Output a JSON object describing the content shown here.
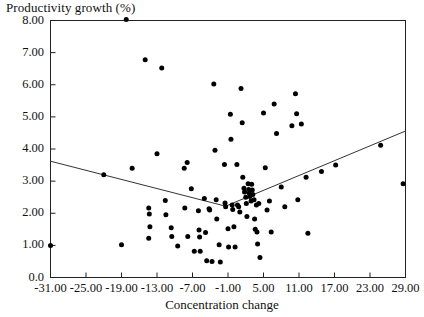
{
  "chart_data": {
    "type": "scatter",
    "title": "",
    "ylabel": "Productivity growth (%)",
    "xlabel": "Concentration change",
    "xlim": [
      -31.0,
      29.0
    ],
    "ylim": [
      0.0,
      8.0
    ],
    "grid": false,
    "legend": "none",
    "xticks": [
      "-31.00",
      "-25.00",
      "-19.00",
      "-13.00",
      "-7.00",
      "-1.00",
      "5.00",
      "11.00",
      "17.00",
      "23.00",
      "29.00"
    ],
    "xtick_values": [
      -31,
      -25,
      -19,
      -13,
      -7,
      -1,
      5,
      11,
      17,
      23,
      29
    ],
    "yticks": [
      "0.0",
      "1.00",
      "2.00",
      "3.00",
      "4.00",
      "5.00",
      "6.00",
      "7.00",
      "8.00"
    ],
    "ytick_values": [
      0,
      1,
      2,
      3,
      4,
      5,
      6,
      7,
      8
    ],
    "marker": "filled-circle",
    "marker_color": "#000000",
    "line_color": "#333333",
    "points": [
      [
        -31.0,
        1.0
      ],
      [
        -22.0,
        3.2
      ],
      [
        -19.0,
        1.02
      ],
      [
        -18.2,
        8.03
      ],
      [
        -17.2,
        3.4
      ],
      [
        -15.0,
        6.78
      ],
      [
        -14.4,
        2.16
      ],
      [
        -14.3,
        1.98
      ],
      [
        -14.2,
        1.58
      ],
      [
        -14.4,
        1.22
      ],
      [
        -13.0,
        3.85
      ],
      [
        -12.2,
        6.52
      ],
      [
        -11.6,
        2.4
      ],
      [
        -11.5,
        1.95
      ],
      [
        -10.6,
        1.55
      ],
      [
        -10.5,
        1.28
      ],
      [
        -9.5,
        0.98
      ],
      [
        -8.4,
        3.4
      ],
      [
        -8.3,
        2.16
      ],
      [
        -7.9,
        3.58
      ],
      [
        -7.8,
        1.28
      ],
      [
        -7.2,
        2.76
      ],
      [
        -6.7,
        0.82
      ],
      [
        -6.0,
        2.08
      ],
      [
        -5.9,
        1.48
      ],
      [
        -5.8,
        1.26
      ],
      [
        -5.7,
        0.82
      ],
      [
        -5.0,
        2.46
      ],
      [
        -4.8,
        1.4
      ],
      [
        -4.6,
        0.52
      ],
      [
        -4.2,
        2.14
      ],
      [
        -4.1,
        2.1
      ],
      [
        -3.7,
        0.5
      ],
      [
        -3.4,
        6.02
      ],
      [
        -3.2,
        3.96
      ],
      [
        -3.0,
        2.42
      ],
      [
        -2.9,
        1.82
      ],
      [
        -2.5,
        1.02
      ],
      [
        -2.3,
        0.48
      ],
      [
        -1.6,
        3.52
      ],
      [
        -1.5,
        2.32
      ],
      [
        -1.4,
        2.2
      ],
      [
        -1.0,
        1.52
      ],
      [
        -0.9,
        0.95
      ],
      [
        -0.6,
        5.08
      ],
      [
        -0.5,
        4.3
      ],
      [
        -0.3,
        2.26
      ],
      [
        -0.2,
        2.12
      ],
      [
        0.0,
        1.58
      ],
      [
        0.2,
        0.95
      ],
      [
        0.5,
        3.52
      ],
      [
        0.6,
        2.26
      ],
      [
        0.8,
        2.2
      ],
      [
        1.0,
        2.04
      ],
      [
        1.2,
        5.88
      ],
      [
        1.4,
        4.82
      ],
      [
        1.5,
        3.12
      ],
      [
        1.7,
        2.78
      ],
      [
        1.8,
        2.66
      ],
      [
        2.0,
        2.5
      ],
      [
        2.1,
        2.3
      ],
      [
        2.2,
        1.9
      ],
      [
        2.4,
        2.92
      ],
      [
        2.5,
        2.74
      ],
      [
        2.6,
        2.62
      ],
      [
        2.7,
        2.52
      ],
      [
        2.9,
        2.38
      ],
      [
        3.0,
        2.9
      ],
      [
        3.1,
        2.72
      ],
      [
        3.2,
        2.58
      ],
      [
        3.4,
        2.42
      ],
      [
        3.5,
        1.82
      ],
      [
        3.6,
        1.5
      ],
      [
        3.8,
        2.26
      ],
      [
        3.9,
        1.42
      ],
      [
        4.0,
        1.04
      ],
      [
        4.2,
        2.3
      ],
      [
        4.4,
        0.62
      ],
      [
        5.0,
        5.12
      ],
      [
        5.3,
        3.42
      ],
      [
        5.6,
        2.1
      ],
      [
        6.0,
        2.38
      ],
      [
        6.3,
        1.42
      ],
      [
        6.8,
        5.4
      ],
      [
        7.2,
        4.48
      ],
      [
        8.0,
        2.82
      ],
      [
        8.6,
        2.2
      ],
      [
        9.8,
        4.72
      ],
      [
        10.4,
        5.72
      ],
      [
        10.6,
        5.1
      ],
      [
        10.8,
        2.42
      ],
      [
        11.4,
        4.78
      ],
      [
        12.2,
        3.12
      ],
      [
        12.5,
        1.38
      ],
      [
        14.8,
        3.3
      ],
      [
        17.2,
        3.5
      ],
      [
        24.8,
        4.12
      ],
      [
        28.6,
        2.92
      ]
    ],
    "fit_line": {
      "description": "piecewise linear fit, V-shaped minimum",
      "vertex": [
        -1.4,
        2.22
      ],
      "left_end": [
        -31.0,
        3.62
      ],
      "right_end": [
        29.0,
        4.56
      ]
    }
  }
}
